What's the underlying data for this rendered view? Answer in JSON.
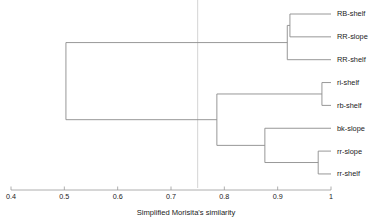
{
  "chart_data": {
    "type": "dendrogram",
    "title": "",
    "xlabel": "Simplified Morisita's similarity",
    "ylabel": "",
    "xlim": [
      0.4,
      1.0
    ],
    "x_ticks": [
      0.4,
      0.5,
      0.6,
      0.7,
      0.8,
      0.9,
      1.0
    ],
    "x_tick_labels": [
      "0.4",
      "0.5",
      "0.6",
      "0.7",
      "0.8",
      "0.9",
      "1"
    ],
    "axis_direction": "increasing-left-to-right",
    "grid": false,
    "legend": "none",
    "reference_line": {
      "x": 0.75,
      "color": "#c9c9c9",
      "style": "solid"
    },
    "line_color": "#8c8c8c",
    "leaves": [
      {
        "label": "RB-shelf",
        "order": 1
      },
      {
        "label": "RR-slope",
        "order": 2
      },
      {
        "label": "RR-shelf",
        "order": 3
      },
      {
        "label": "ri-shelf",
        "order": 4
      },
      {
        "label": "rb-shelf",
        "order": 5
      },
      {
        "label": "bk-slope",
        "order": 6
      },
      {
        "label": "rr-slope",
        "order": 7
      },
      {
        "label": "rr-shelf",
        "order": 8
      }
    ],
    "merges": [
      {
        "id": "m1",
        "children": [
          "RB-shelf",
          "RR-slope"
        ],
        "similarity": 0.923
      },
      {
        "id": "m2",
        "children": [
          "m1",
          "RR-shelf"
        ],
        "similarity": 0.918
      },
      {
        "id": "m3",
        "children": [
          "ri-shelf",
          "rb-shelf"
        ],
        "similarity": 0.983
      },
      {
        "id": "m4",
        "children": [
          "rr-slope",
          "rr-shelf"
        ],
        "similarity": 0.976
      },
      {
        "id": "m5",
        "children": [
          "bk-slope",
          "m4"
        ],
        "similarity": 0.876
      },
      {
        "id": "m6",
        "children": [
          "m3",
          "m5"
        ],
        "similarity": 0.786
      },
      {
        "id": "m7",
        "children": [
          "m2",
          "m6"
        ],
        "similarity": 0.503
      }
    ]
  },
  "chart": {
    "axis_title": "Simplified Morisita's similarity"
  }
}
